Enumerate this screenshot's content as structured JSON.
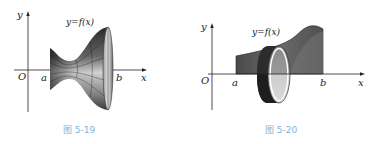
{
  "figures": [
    {
      "id": "fig-5-19",
      "caption": "图 5-19",
      "curve_label": "y=f(x)",
      "axes": {
        "x_label": "x",
        "y_label": "y",
        "origin_label": "O"
      },
      "interval": {
        "a_label": "a",
        "b_label": "b"
      },
      "description": "Solid of revolution formed by rotating y=f(x) on [a,b] about the x-axis"
    },
    {
      "id": "fig-5-20",
      "caption": "图 5-20",
      "curve_label": "y=f(x)",
      "axes": {
        "x_label": "x",
        "y_label": "y",
        "origin_label": "O"
      },
      "interval": {
        "a_label": "a",
        "b_label": "b"
      },
      "description": "Region under y=f(x) on [a,b] with a thin disc slice perpendicular to the x-axis"
    }
  ],
  "colors": {
    "caption": "#7fb2d8",
    "axis": "#222222",
    "region_dark": "#555555",
    "disc_fill": "#cfcfcf"
  }
}
